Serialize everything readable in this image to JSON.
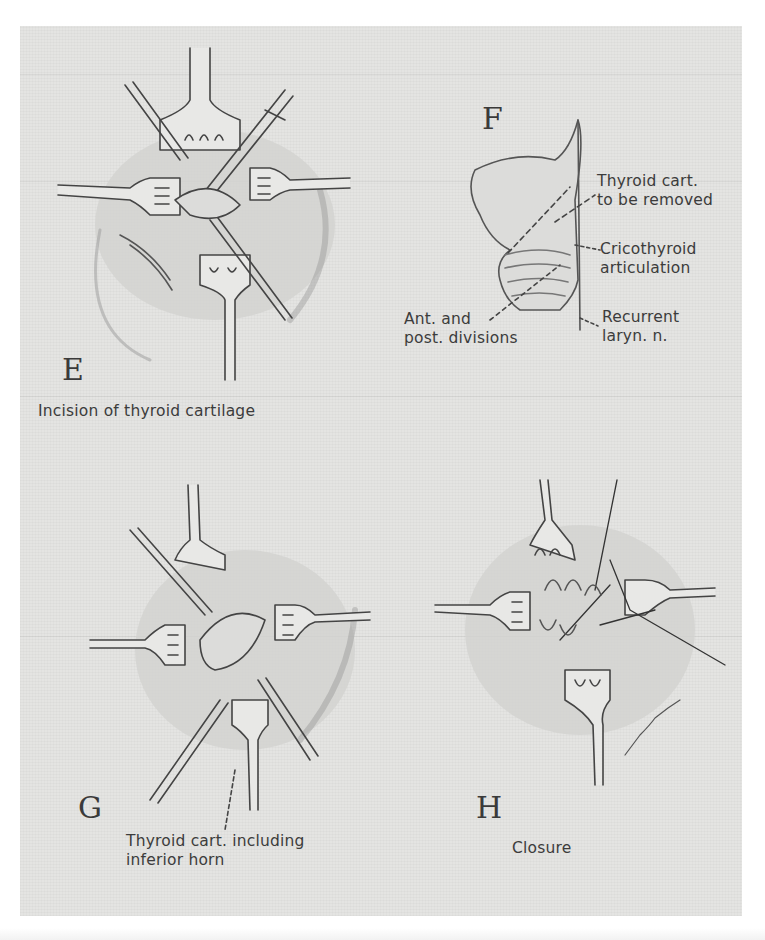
{
  "figure": {
    "background_color": "#e4e4e2",
    "ink_color": "#3a3a3a",
    "panels": [
      {
        "id": "E",
        "letter": "E",
        "caption": "Incision of thyroid cartilage",
        "labels": []
      },
      {
        "id": "F",
        "letter": "F",
        "caption": "",
        "labels": [
          {
            "line1": "Thyroid cart.",
            "line2": "to be removed"
          },
          {
            "line1": "Cricothyroid",
            "line2": "articulation"
          },
          {
            "line1": "Recurrent",
            "line2": "laryn. n."
          },
          {
            "line1": "Ant. and",
            "line2": "post. divisions"
          }
        ]
      },
      {
        "id": "G",
        "letter": "G",
        "caption": "",
        "labels": [
          {
            "line1": "Thyroid cart. including",
            "line2": "inferior horn"
          }
        ]
      },
      {
        "id": "H",
        "letter": "H",
        "caption": "Closure",
        "labels": [],
        "signature": "W.E. Loechel"
      }
    ]
  }
}
